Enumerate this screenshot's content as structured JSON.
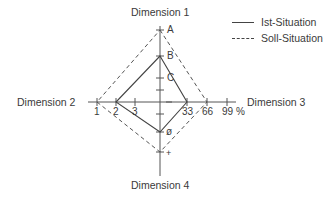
{
  "diagram": {
    "type": "radar-diamond",
    "axes": {
      "top": {
        "label": "Dimension 1",
        "ticks": [
          "A",
          "B",
          "C"
        ]
      },
      "left": {
        "label": "Dimension 2",
        "ticks": [
          "1",
          "2",
          "3"
        ]
      },
      "right": {
        "label": "Dimension 3",
        "ticks": [
          "33",
          "66",
          "99 %"
        ]
      },
      "bottom": {
        "label": "Dimension 4",
        "ticks": [
          "ø",
          "+"
        ]
      }
    },
    "legend": {
      "items": [
        {
          "label": "Ist-Situation",
          "style": "solid"
        },
        {
          "label": "Soll-Situation",
          "style": "dashed"
        }
      ]
    },
    "series": [
      {
        "name": "Ist-Situation",
        "style": "solid",
        "points": {
          "Dimension 1": "B",
          "Dimension 3": "33",
          "Dimension 4": "ø",
          "Dimension 2": "2"
        }
      },
      {
        "name": "Soll-Situation",
        "style": "dashed",
        "points": {
          "Dimension 1": "A",
          "Dimension 3": "66",
          "Dimension 4": "+",
          "Dimension 2": "1"
        }
      }
    ],
    "colors": {
      "line": "#444444",
      "text": "#3a3a3a",
      "background": "#ffffff"
    }
  }
}
